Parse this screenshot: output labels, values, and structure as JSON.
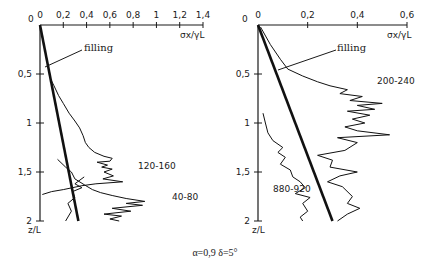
{
  "caption": "α=0,9 δ=5°",
  "chart_data": [
    {
      "type": "line",
      "title": "",
      "xlabel": "σx/γL",
      "ylabel": "z/L",
      "x_ticks": [
        "0",
        "0,2",
        "0,4",
        "0,6",
        "0,8",
        "1",
        "1,2",
        "1,4"
      ],
      "x_tick_values": [
        0,
        0.2,
        0.4,
        0.6,
        0.8,
        1.0,
        1.2,
        1.4
      ],
      "y_ticks": [
        "0",
        "0,5",
        "1",
        "1,5",
        "2"
      ],
      "y_tick_values": [
        0,
        0.5,
        1.0,
        1.5,
        2.0
      ],
      "xlim": [
        0,
        1.4
      ],
      "ylim": [
        0,
        2
      ],
      "y_inverted": true,
      "x_axis_position": "top",
      "grid": false,
      "annotations": [
        "filling",
        "120-160",
        "40-80"
      ],
      "series": [
        {
          "name": "filling",
          "style": "thick",
          "points": [
            [
              0,
              0
            ],
            [
              0.33,
              2.0
            ]
          ]
        },
        {
          "name": "120-160",
          "points": [
            [
              0.09,
              0.55
            ],
            [
              0.12,
              0.62
            ],
            [
              0.16,
              0.72
            ],
            [
              0.2,
              0.8
            ],
            [
              0.25,
              0.9
            ],
            [
              0.3,
              0.98
            ],
            [
              0.34,
              1.05
            ],
            [
              0.37,
              1.13
            ],
            [
              0.39,
              1.2
            ],
            [
              0.42,
              1.25
            ],
            [
              0.47,
              1.3
            ],
            [
              0.55,
              1.34
            ],
            [
              0.62,
              1.36
            ],
            [
              0.6,
              1.39
            ],
            [
              0.49,
              1.4
            ],
            [
              0.58,
              1.43
            ],
            [
              0.53,
              1.45
            ],
            [
              0.62,
              1.47
            ],
            [
              0.55,
              1.5
            ],
            [
              0.63,
              1.54
            ],
            [
              0.54,
              1.57
            ],
            [
              0.71,
              1.6
            ],
            [
              0.48,
              1.62
            ],
            [
              0.36,
              1.64
            ],
            [
              0.2,
              1.68
            ],
            [
              0.1,
              1.7
            ],
            [
              0.02,
              1.73
            ]
          ]
        },
        {
          "name": "40-80",
          "points": [
            [
              0.15,
              1.37
            ],
            [
              0.22,
              1.45
            ],
            [
              0.27,
              1.5
            ],
            [
              0.3,
              1.57
            ],
            [
              0.38,
              1.63
            ],
            [
              0.45,
              1.68
            ],
            [
              0.52,
              1.71
            ],
            [
              0.62,
              1.74
            ],
            [
              0.74,
              1.77
            ],
            [
              0.9,
              1.8
            ],
            [
              0.74,
              1.82
            ],
            [
              0.88,
              1.84
            ],
            [
              0.62,
              1.87
            ],
            [
              0.78,
              1.9
            ],
            [
              0.55,
              1.93
            ],
            [
              0.7,
              1.95
            ],
            [
              0.6,
              1.98
            ],
            [
              0.68,
              2.0
            ]
          ]
        },
        {
          "name": "40-80 inner",
          "points": [
            [
              0.38,
              1.55
            ],
            [
              0.3,
              1.62
            ],
            [
              0.36,
              1.66
            ],
            [
              0.28,
              1.7
            ],
            [
              0.3,
              1.76
            ],
            [
              0.24,
              1.82
            ],
            [
              0.27,
              1.9
            ],
            [
              0.22,
              2.0
            ]
          ]
        }
      ]
    },
    {
      "type": "line",
      "title": "",
      "xlabel": "σx/γL",
      "ylabel": "z/L",
      "x_ticks": [
        "0",
        "0,2",
        "0,4",
        "0,6"
      ],
      "x_tick_values": [
        0,
        0.2,
        0.4,
        0.6
      ],
      "y_ticks": [
        "0",
        "0,5",
        "1",
        "1,5",
        "2"
      ],
      "y_tick_values": [
        0,
        0.5,
        1.0,
        1.5,
        2.0
      ],
      "xlim": [
        0,
        0.6
      ],
      "ylim": [
        0,
        2
      ],
      "y_inverted": true,
      "x_axis_position": "top",
      "grid": false,
      "annotations": [
        "filling",
        "200-240",
        "880-920"
      ],
      "series": [
        {
          "name": "filling",
          "style": "thick",
          "points": [
            [
              0,
              0
            ],
            [
              0.3,
              2.0
            ]
          ]
        },
        {
          "name": "200-240",
          "points": [
            [
              0.01,
              0.02
            ],
            [
              0.05,
              0.2
            ],
            [
              0.09,
              0.35
            ],
            [
              0.12,
              0.45
            ],
            [
              0.18,
              0.52
            ],
            [
              0.24,
              0.58
            ],
            [
              0.29,
              0.62
            ],
            [
              0.36,
              0.66
            ],
            [
              0.33,
              0.7
            ],
            [
              0.42,
              0.73
            ],
            [
              0.37,
              0.77
            ],
            [
              0.5,
              0.8
            ],
            [
              0.4,
              0.82
            ],
            [
              0.47,
              0.86
            ],
            [
              0.36,
              0.88
            ],
            [
              0.45,
              0.92
            ],
            [
              0.38,
              0.96
            ],
            [
              0.43,
              1.0
            ],
            [
              0.35,
              1.04
            ],
            [
              0.4,
              1.08
            ],
            [
              0.53,
              1.12
            ],
            [
              0.32,
              1.15
            ],
            [
              0.4,
              1.2
            ],
            [
              0.35,
              1.28
            ],
            [
              0.24,
              1.33
            ],
            [
              0.3,
              1.38
            ],
            [
              0.29,
              1.45
            ],
            [
              0.4,
              1.5
            ],
            [
              0.33,
              1.54
            ],
            [
              0.28,
              1.6
            ],
            [
              0.34,
              1.65
            ],
            [
              0.38,
              1.75
            ],
            [
              0.36,
              1.82
            ],
            [
              0.41,
              1.87
            ],
            [
              0.36,
              1.93
            ],
            [
              0.32,
              2.0
            ]
          ]
        },
        {
          "name": "880-920",
          "points": [
            [
              0.02,
              0.9
            ],
            [
              0.03,
              1.0
            ],
            [
              0.04,
              1.1
            ],
            [
              0.06,
              1.18
            ],
            [
              0.1,
              1.25
            ],
            [
              0.08,
              1.3
            ],
            [
              0.11,
              1.35
            ],
            [
              0.09,
              1.42
            ],
            [
              0.13,
              1.48
            ],
            [
              0.14,
              1.55
            ],
            [
              0.17,
              1.6
            ],
            [
              0.19,
              1.66
            ],
            [
              0.15,
              1.72
            ],
            [
              0.21,
              1.76
            ],
            [
              0.18,
              1.82
            ],
            [
              0.2,
              1.9
            ],
            [
              0.17,
              1.96
            ],
            [
              0.18,
              2.0
            ]
          ]
        }
      ]
    }
  ]
}
